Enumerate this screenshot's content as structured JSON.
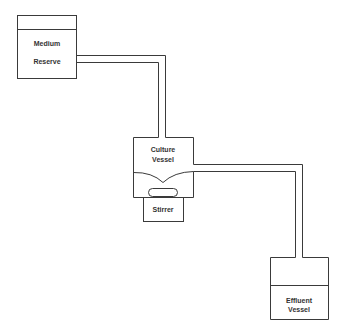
{
  "diagram": {
    "type": "chemostat-flow-schematic",
    "colors": {
      "line": "#3a3a3a",
      "background": "#ffffff"
    },
    "nodes": [
      {
        "id": "medium-reserve",
        "label_line1": "Medium",
        "label_line2": "Reserve"
      },
      {
        "id": "culture-vessel",
        "label_line1": "Culture",
        "label_line2": "Vessel"
      },
      {
        "id": "stirrer",
        "label": "Stirrer"
      },
      {
        "id": "effluent-vessel",
        "label_line1": "Effluent",
        "label_line2": "Vessel"
      }
    ],
    "edges": [
      {
        "from": "medium-reserve",
        "to": "culture-vessel"
      },
      {
        "from": "culture-vessel",
        "to": "effluent-vessel"
      }
    ]
  }
}
